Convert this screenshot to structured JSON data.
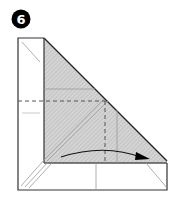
{
  "step": {
    "number": "6",
    "badge_color": "#000000",
    "badge_text_color": "#ffffff"
  },
  "diagram": {
    "line_color": "#333333",
    "shade_color": "#d0d0d0",
    "hatch_color": "#b5b5b5",
    "crease_color": "#999999",
    "arrow_color": "#000000",
    "elements": [
      {
        "name": "paper-outline"
      },
      {
        "name": "shaded-triangle-flap"
      },
      {
        "name": "valley-fold-dashed-lines"
      },
      {
        "name": "fold-arrow",
        "direction": "right"
      }
    ]
  }
}
